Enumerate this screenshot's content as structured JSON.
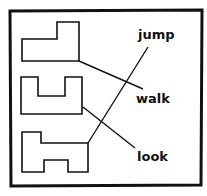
{
  "diagram": {
    "words": [
      {
        "id": "jump",
        "label": "jump"
      },
      {
        "id": "walk",
        "label": "walk"
      },
      {
        "id": "look",
        "label": "look"
      }
    ],
    "shapes": [
      {
        "id": "shape-l",
        "description": "L-shaped outline",
        "matched_word": "walk"
      },
      {
        "id": "shape-u",
        "description": "U-shaped outline",
        "matched_word": "look"
      },
      {
        "id": "shape-h",
        "description": "H-like stepped outline",
        "matched_word": "jump"
      }
    ],
    "colors": {
      "stroke": "#111111",
      "background": "#ffffff"
    }
  }
}
